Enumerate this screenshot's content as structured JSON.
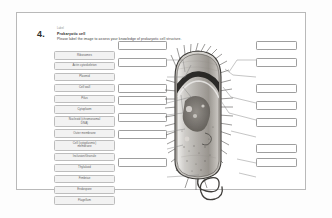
{
  "question": {
    "number": "4.",
    "meta": "Label",
    "title": "Prokaryotic cell",
    "prompt": "Please label the image to assess your knowledge of prokaryotic cell structure."
  },
  "label_bank": {
    "name": "draggable-label-bank",
    "items": [
      {
        "id": "ribosomes",
        "label": "Ribosomes",
        "lines": 1
      },
      {
        "id": "actin-cytoskeleton",
        "label": "Actin cytoskeleton",
        "lines": 1
      },
      {
        "id": "plasmid",
        "label": "Plasmid",
        "lines": 1
      },
      {
        "id": "cell-wall",
        "label": "Cell wall",
        "lines": 1
      },
      {
        "id": "pilus",
        "label": "Pilus",
        "lines": 1
      },
      {
        "id": "cytoplasm",
        "label": "Cytoplasm",
        "lines": 1
      },
      {
        "id": "nucleoid-dna",
        "label": "Nucleoid (chromosomal\nDNA)",
        "lines": 2
      },
      {
        "id": "outer-membrane",
        "label": "Outer membrane",
        "lines": 1
      },
      {
        "id": "cell-cytoplasmic-membrane",
        "label": "Cell (cytoplasmic)\nmembrane",
        "lines": 2
      },
      {
        "id": "inclusion-granule",
        "label": "Inclusion/Granule",
        "lines": 1
      },
      {
        "id": "thylakoid",
        "label": "Thylakoid",
        "lines": 1
      },
      {
        "id": "fimbriae",
        "label": "Fimbriae",
        "lines": 1
      },
      {
        "id": "endospore",
        "label": "Endospore",
        "lines": 1
      },
      {
        "id": "flagellum",
        "label": "Flagellum",
        "lines": 1
      }
    ]
  },
  "drop_zones": {
    "left": [
      {
        "id": "left-1",
        "value": "",
        "placeholder": ""
      },
      {
        "id": "left-2",
        "value": "",
        "placeholder": ""
      },
      {
        "id": "left-3",
        "value": "",
        "placeholder": ""
      },
      {
        "id": "left-4",
        "value": "",
        "placeholder": ""
      },
      {
        "id": "left-5",
        "value": "",
        "placeholder": ""
      },
      {
        "id": "left-6",
        "value": "",
        "placeholder": ""
      },
      {
        "id": "left-7",
        "value": "",
        "placeholder": ""
      }
    ],
    "right": [
      {
        "id": "right-1",
        "value": "",
        "placeholder": ""
      },
      {
        "id": "right-2",
        "value": "",
        "placeholder": ""
      },
      {
        "id": "right-3",
        "value": "",
        "placeholder": ""
      },
      {
        "id": "right-4",
        "value": "",
        "placeholder": ""
      },
      {
        "id": "right-5",
        "value": "",
        "placeholder": ""
      },
      {
        "id": "right-6",
        "value": "",
        "placeholder": ""
      },
      {
        "id": "right-7",
        "value": "",
        "placeholder": ""
      }
    ]
  },
  "diagram": {
    "name": "prokaryotic-cell-micrograph"
  },
  "colors": {
    "card_border": "#b9b9b9",
    "pill_fill": "#f2f2f2",
    "pill_border": "#bdbdbd",
    "drop_border": "#9e9e9e",
    "leader_line": "#7d7d7d",
    "text": "#3a3a3a"
  }
}
